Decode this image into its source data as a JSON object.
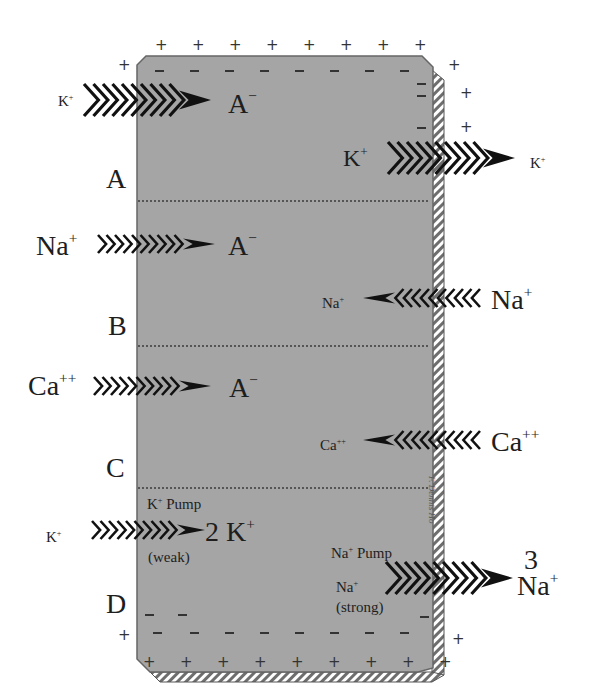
{
  "diagram": {
    "compartments": [
      {
        "label": "A",
        "left_ion": "K",
        "left_charge": "+",
        "inner_anion": "A",
        "inner_charge": "−",
        "right_inner_ion": "K",
        "right_inner_charge": "+",
        "right_outer_ion": "K",
        "right_outer_charge": "+",
        "right_direction": "out"
      },
      {
        "label": "B",
        "left_ion": "Na",
        "left_charge": "+",
        "inner_anion": "A",
        "inner_charge": "−",
        "right_inner_ion": "Na",
        "right_inner_charge": "+",
        "right_outer_ion": "Na",
        "right_outer_charge": "+",
        "right_direction": "in"
      },
      {
        "label": "C",
        "left_ion": "Ca",
        "left_charge": "++",
        "inner_anion": "A",
        "inner_charge": "−",
        "right_inner_ion": "Ca",
        "right_inner_charge": "++",
        "right_outer_ion": "Ca",
        "right_outer_charge": "++",
        "right_direction": "in"
      },
      {
        "label": "D",
        "left_ion": "K",
        "left_charge": "+",
        "k_pump_label": "K",
        "k_pump_charge": "+",
        "k_pump_word": "Pump",
        "k_pump_result": "2 K",
        "k_pump_result_charge": "+",
        "k_pump_strength": "(weak)",
        "na_pump_label": "Na",
        "na_pump_charge": "+",
        "na_pump_word": "Pump",
        "na_pump_inner": "Na",
        "na_pump_inner_charge": "+",
        "na_pump_strength": "(strong)",
        "na_pump_count": "3",
        "na_pump_result": "Na",
        "na_pump_result_charge": "+"
      }
    ],
    "outside_charge": "+",
    "inside_charge": "−",
    "signature": "F. Dennis Ho",
    "colors": {
      "cell_fill": "#a3a3a3",
      "cell_border": "#6b6b6b",
      "arrow": "#111111",
      "hatch": "#7a7a7a"
    }
  }
}
